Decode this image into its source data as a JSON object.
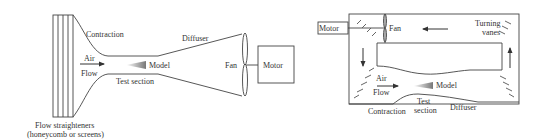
{
  "diagram": {
    "open_circuit": {
      "labels": {
        "contraction": "Contraction",
        "air": "Air",
        "flow": "Flow",
        "model": "Model",
        "test_section": "Test section",
        "diffuser": "Diffuser",
        "fan": "Fan",
        "motor": "Motor",
        "straighteners_line1": "Flow straighteners",
        "straighteners_line2": "(honeycomb or screens)"
      }
    },
    "closed_circuit": {
      "labels": {
        "motor": "Motor",
        "fan": "Fan",
        "turning_vanes_line1": "Turning",
        "turning_vanes_line2": "vanes",
        "air": "Air",
        "flow": "Flow",
        "model": "Model",
        "contraction": "Contraction",
        "test_line1": "Test",
        "test_line2": "section",
        "diffuser": "Diffuser"
      }
    },
    "colors": {
      "line": "#444444",
      "text": "#333333",
      "model_fill": "#888888"
    }
  }
}
